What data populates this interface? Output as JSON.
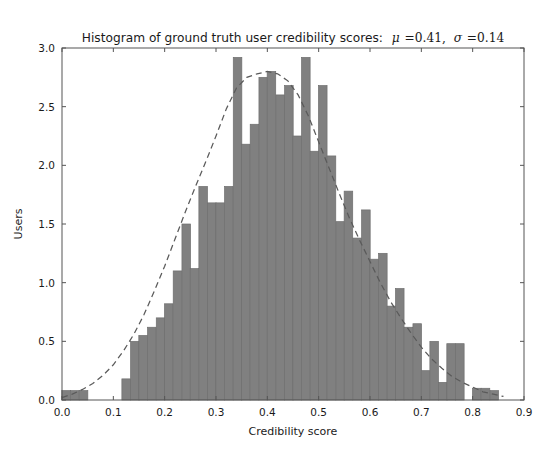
{
  "figure": {
    "width": 547,
    "height": 463,
    "background": "#ffffff"
  },
  "title": {
    "prefix": "Histogram of ground truth user credibility scores:",
    "mu_symbol": "μ",
    "mu_value": "=0.41,",
    "sigma_symbol": "σ",
    "sigma_value": "=0.14"
  },
  "axes": {
    "xlabel": "Credibility score",
    "ylabel": "Users",
    "xticks": [
      "0.0",
      "0.1",
      "0.2",
      "0.3",
      "0.4",
      "0.5",
      "0.6",
      "0.7",
      "0.8",
      "0.9"
    ],
    "yticks": [
      "0.0",
      "0.5",
      "1.0",
      "1.5",
      "2.0",
      "2.5",
      "3.0"
    ]
  },
  "colors": {
    "bar_fill": "#808080",
    "bar_edge": "#6e6e6e",
    "fit_line": "#5a5a5a",
    "spine": "#555555",
    "text": "#1a1a1a"
  },
  "chart_data": {
    "type": "bar",
    "xlabel": "Credibility score",
    "ylabel": "Users",
    "xlim": [
      0.0,
      0.9
    ],
    "ylim": [
      0.0,
      3.0
    ],
    "grid": false,
    "legend": "none",
    "bin_width": 0.0167,
    "mu": 0.41,
    "sigma": 0.14,
    "bin_centers": [
      0.008,
      0.025,
      0.042,
      0.058,
      0.075,
      0.092,
      0.108,
      0.125,
      0.142,
      0.158,
      0.175,
      0.192,
      0.208,
      0.225,
      0.242,
      0.258,
      0.275,
      0.292,
      0.308,
      0.325,
      0.342,
      0.358,
      0.375,
      0.392,
      0.408,
      0.425,
      0.442,
      0.458,
      0.475,
      0.492,
      0.508,
      0.525,
      0.542,
      0.558,
      0.575,
      0.592,
      0.608,
      0.625,
      0.642,
      0.658,
      0.675,
      0.692,
      0.708,
      0.725,
      0.742,
      0.758,
      0.775,
      0.792,
      0.808,
      0.825,
      0.842
    ],
    "values": [
      0.08,
      0.08,
      0.08,
      0.0,
      0.0,
      0.0,
      0.0,
      0.18,
      0.5,
      0.55,
      0.62,
      0.7,
      0.82,
      1.1,
      1.5,
      1.12,
      1.82,
      1.68,
      1.68,
      1.82,
      2.92,
      2.18,
      2.35,
      2.75,
      2.8,
      2.6,
      2.68,
      2.25,
      2.92,
      2.12,
      2.68,
      2.08,
      1.52,
      1.78,
      1.38,
      1.62,
      1.2,
      1.25,
      0.8,
      0.95,
      0.62,
      0.65,
      0.25,
      0.5,
      0.15,
      0.48,
      0.48,
      0.0,
      0.1,
      0.1,
      0.08
    ],
    "fit_curve": {
      "style": "dashed",
      "description": "Gaussian-like kernel density fit overlay",
      "x": [
        0.0,
        0.02,
        0.04,
        0.06,
        0.08,
        0.1,
        0.12,
        0.14,
        0.16,
        0.18,
        0.2,
        0.22,
        0.24,
        0.26,
        0.28,
        0.3,
        0.32,
        0.34,
        0.36,
        0.38,
        0.4,
        0.42,
        0.44,
        0.46,
        0.48,
        0.5,
        0.52,
        0.54,
        0.56,
        0.58,
        0.6,
        0.62,
        0.64,
        0.66,
        0.68,
        0.7,
        0.72,
        0.74,
        0.76,
        0.78,
        0.8,
        0.82,
        0.84,
        0.86
      ],
      "y": [
        0.02,
        0.05,
        0.09,
        0.14,
        0.21,
        0.3,
        0.42,
        0.56,
        0.73,
        0.93,
        1.14,
        1.37,
        1.6,
        1.82,
        2.03,
        2.25,
        2.48,
        2.66,
        2.75,
        2.78,
        2.8,
        2.78,
        2.72,
        2.6,
        2.42,
        2.2,
        1.98,
        1.76,
        1.55,
        1.36,
        1.18,
        1.0,
        0.84,
        0.7,
        0.57,
        0.45,
        0.35,
        0.27,
        0.2,
        0.15,
        0.11,
        0.07,
        0.05,
        0.03
      ]
    }
  }
}
